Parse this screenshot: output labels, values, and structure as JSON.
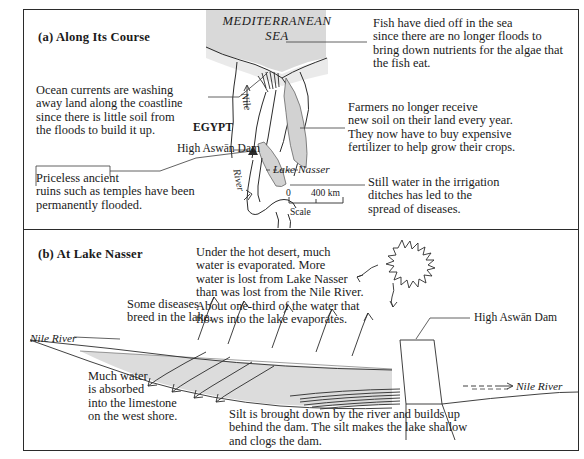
{
  "figure": {
    "sections": [
      {
        "id": "a",
        "label": "(a) Along Its Course"
      },
      {
        "id": "b",
        "label": "(b) At Lake Nasser"
      }
    ]
  },
  "map": {
    "sea_label": "MEDITERRANEAN\nSEA",
    "country_label": "EGYPT",
    "nile_label": "Nile",
    "river_label": "River",
    "lake_label": "Lake Nasser",
    "dam_label": "High Aswān Dam",
    "scale": {
      "zero": "0",
      "distance": "400 km",
      "caption": "Scale"
    }
  },
  "callouts_a": [
    {
      "name": "fish-died-off",
      "text": "Fish have died off in the sea\nsince there are no longer floods to\nbring down nutrients for the algae that\nthe fish eat."
    },
    {
      "name": "ocean-currents",
      "text": "Ocean currents are washing\naway land along the coastline\nsince there is little soil from\nthe floods to build it up."
    },
    {
      "name": "farmers-fertilizer",
      "text": "Farmers no longer receive\nnew soil on their land every year.\nThey now have to buy expensive\nfertilizer to help grow their crops."
    },
    {
      "name": "ancient-ruins-flooded",
      "text": "Priceless ancient\nruins such as temples have been\npermanently flooded."
    },
    {
      "name": "irrigation-diseases",
      "text": "Still water in the irrigation\nditches has led to the\nspread of diseases."
    }
  ],
  "callouts_b": [
    {
      "name": "evaporation",
      "text": "Under the hot desert, much\nwater is evaporated. More\nwater is lost from Lake Nasser\nthan was lost from the Nile River.\nAbout one-third of the water that\nflows into the lake evaporates."
    },
    {
      "name": "diseases-breed",
      "text": "Some diseases\nbreed in the lake."
    },
    {
      "name": "water-absorbed",
      "text": "Much water\nis absorbed\ninto the limestone\non the west shore."
    },
    {
      "name": "silt-buildup",
      "text": "Silt is brought down by the river and builds up\nbehind the dam. The silt makes the lake shallow\nand clogs the dam."
    }
  ],
  "cross_section": {
    "dam_label": "High Aswān Dam",
    "river_left_label": "Nile River",
    "river_right_label": "Nile River",
    "sun_icon": "sun-burst-icon"
  },
  "colors": {
    "ink": "#2b2b2b",
    "water_fill": "#d9d9d9",
    "land_fill": "#ffffff",
    "page": "#ffffff"
  }
}
